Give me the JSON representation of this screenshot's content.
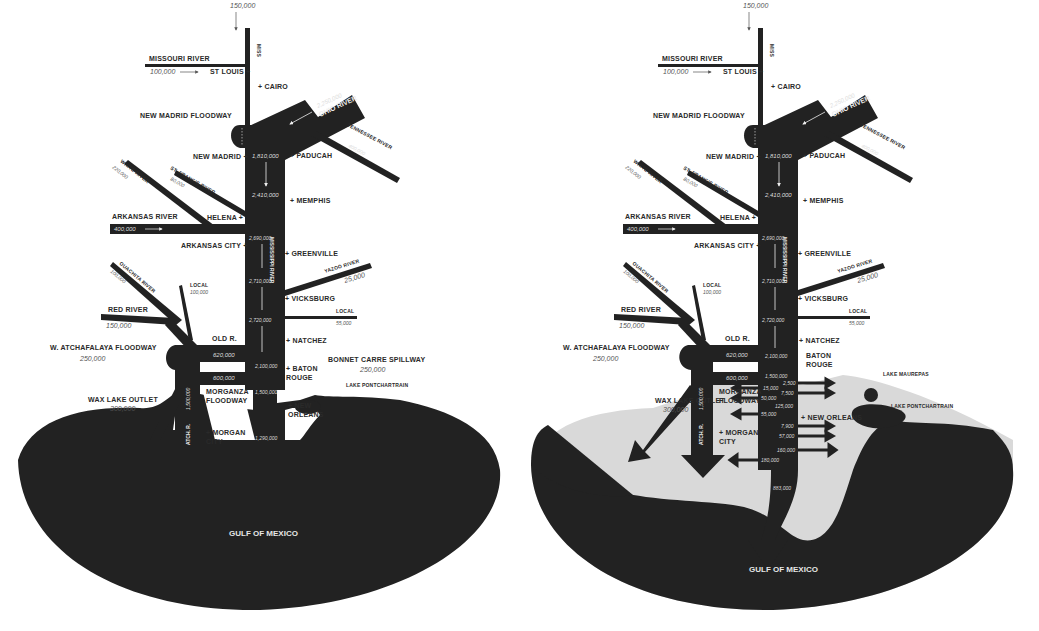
{
  "colors": {
    "land_water": "#222222",
    "background": "#ffffff",
    "flooded_area": "#d9d9d9",
    "label_text": "#2a2a2a",
    "value_text": "#555555"
  },
  "maps": [
    {
      "id": "left",
      "title_region": "Mississippi River flood flows (cubic feet per second)",
      "rivers": {
        "miss_upper": {
          "label": "MISS",
          "value": "150,000"
        },
        "missouri": {
          "label": "MISSOURI RIVER",
          "value": "100,000"
        },
        "ohio": {
          "label": "OHIO RIVER",
          "value": "2,250,000"
        },
        "tennessee": {
          "label": "TENNESSEE RIVER",
          "value": "400,000"
        },
        "white": {
          "label": "WHITE RIVER",
          "value": "220,000"
        },
        "st_francis": {
          "label": "ST. FRANCIS RIVER",
          "value": "80,000"
        },
        "arkansas": {
          "label": "ARKANSAS RIVER",
          "value": "400,000"
        },
        "yazoo": {
          "label": "YAZOO RIVER",
          "value": "25,000"
        },
        "local_east": {
          "label": "LOCAL",
          "value": "55,000"
        },
        "ouachita": {
          "label": "OUACHITA RIVER",
          "value": "100,000"
        },
        "local_west": {
          "label": "LOCAL",
          "value": "100,000"
        },
        "red": {
          "label": "RED RIVER",
          "value": "150,000"
        },
        "mississippi": {
          "label": "MISSISSIPPI RIVER"
        },
        "atchafalaya": {
          "label": "ATCH. R.",
          "value": "1,500,000"
        }
      },
      "main_flows": [
        "1,810,000",
        "2,410,000",
        "2,690,000",
        "2,710,000",
        "2,720,000",
        "2,100,000",
        "1,500,000",
        "1,290,000"
      ],
      "diversions": {
        "old_river": {
          "label": "OLD R.",
          "value": "620,000"
        },
        "morganza": {
          "label_line1": "MORGANZA",
          "label_line2": "FLOODWAY",
          "value": "600,000"
        },
        "w_atchafalaya": {
          "label": "W. ATCHAFALAYA FLOODWAY",
          "value": "250,000"
        },
        "wax_lake": {
          "label": "WAX LAKE OUTLET",
          "value": "300,000"
        },
        "bonnet_carre": {
          "label": "BONNET CARRE SPILLWAY",
          "value": "250,000"
        },
        "new_madrid": {
          "label": "NEW MADRID FLOODWAY"
        }
      },
      "cities": {
        "st_louis": "ST LOUIS +",
        "cairo": "+ CAIRO",
        "new_madrid": "NEW MADRID +",
        "paducah": "+ PADUCAH",
        "memphis": "+ MEMPHIS",
        "helena": "HELENA +",
        "arkansas_city": "ARKANSAS CITY +",
        "greenville": "+ GREENVILLE",
        "vicksburg": "+ VICKSBURG",
        "natchez": "+ NATCHEZ",
        "baton_rouge_1": "+ BATON",
        "baton_rouge_2": "ROUGE",
        "new_orleans_1": "+ NEW",
        "new_orleans_2": "ORLEANS",
        "morgan_city_1": "+ MORGAN",
        "morgan_city_2": "CITY",
        "lake_pontchartrain": "LAKE PONTCHARTRAIN"
      },
      "gulf": "GULF OF MEXICO"
    },
    {
      "id": "right",
      "rivers": {
        "miss_upper": {
          "label": "MISS",
          "value": "150,000"
        },
        "missouri": {
          "label": "MISSOURI RIVER",
          "value": "100,000"
        },
        "ohio": {
          "label": "OHIO RIVER",
          "value": "2,250,000"
        },
        "tennessee": {
          "label": "TENNESSEE RIVER",
          "value": "400,000"
        },
        "white": {
          "label": "WHITE RIVER",
          "value": "220,000"
        },
        "st_francis": {
          "label": "ST. FRANCIS RIVER",
          "value": "80,000"
        },
        "arkansas": {
          "label": "ARKANSAS RIVER",
          "value": "400,000"
        },
        "yazoo": {
          "label": "YAZOO RIVER",
          "value": "25,000"
        },
        "local_east": {
          "label": "LOCAL",
          "value": "55,000"
        },
        "ouachita": {
          "label": "OUACHITA RIVER",
          "value": "100,000"
        },
        "local_west": {
          "label": "LOCAL",
          "value": "100,000"
        },
        "red": {
          "label": "RED RIVER",
          "value": "150,000"
        },
        "mississippi": {
          "label": "MISSISSIPPI RIVER"
        },
        "atchafalaya": {
          "label": "ATCH. R.",
          "value": "1,500,000"
        }
      },
      "main_flows": [
        "1,810,000",
        "2,410,000",
        "2,690,000",
        "2,710,000",
        "2,720,000",
        "2,100,000",
        "1,500,000",
        "883,000"
      ],
      "crevasse_flows": [
        "2,500",
        "15,000",
        "7,500",
        "50,000",
        "125,000",
        "55,000",
        "7,900",
        "57,000",
        "160,000",
        "180,000"
      ],
      "diversions": {
        "old_river": {
          "label": "OLD R.",
          "value": "620,000"
        },
        "morganza": {
          "label_line1": "MORGANZA",
          "label_line2": "FLOODWAY",
          "value": "600,000"
        },
        "w_atchafalaya": {
          "label": "W. ATCHAFALAYA FLOODWAY",
          "value": "250,000"
        },
        "wax_lake": {
          "label": "WAX LAKE OUTLET",
          "value": "300,000"
        },
        "new_madrid": {
          "label": "NEW MADRID FLOODWAY"
        }
      },
      "cities": {
        "st_louis": "ST LOUIS +",
        "cairo": "+ CAIRO",
        "new_madrid": "NEW MADRID +",
        "paducah": "+ PADUCAH",
        "memphis": "+ MEMPHIS",
        "helena": "HELENA +",
        "arkansas_city": "ARKANSAS CITY +",
        "greenville": "+ GREENVILLE",
        "vicksburg": "+ VICKSBURG",
        "natchez": "+ NATCHEZ",
        "baton_rouge_1": "BATON",
        "baton_rouge_2": "ROUGE",
        "new_orleans": "+ NEW ORLEANS",
        "morgan_city_1": "+ MORGAN",
        "morgan_city_2": "CITY",
        "lake_maurepas": "LAKE MAUREPAS",
        "lake_pontchartrain": "LAKE PONTCHARTRAIN"
      },
      "gulf": "GULF OF MEXICO"
    }
  ]
}
